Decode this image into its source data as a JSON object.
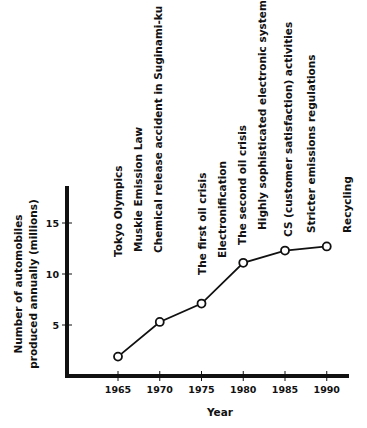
{
  "chart_data": {
    "type": "line",
    "title": "",
    "xlabel": "Year",
    "ylabel": [
      "Number of automobiles",
      "produced annually (millions)"
    ],
    "x": [
      1965,
      1970,
      1975,
      1980,
      1985,
      1990
    ],
    "series": [
      {
        "name": "Automobiles produced annually (millions)",
        "values": [
          1.9,
          5.3,
          7.1,
          11.1,
          12.3,
          12.7
        ]
      }
    ],
    "xlim": [
      1960,
      1992
    ],
    "ylim": [
      0,
      18.5
    ],
    "x_ticks": [
      "1965",
      "1970",
      "1975",
      "1980",
      "1985",
      "1990"
    ],
    "y_ticks": [
      "5",
      "10",
      "15"
    ],
    "y_tick_values": [
      5,
      10,
      15
    ],
    "grid": false,
    "legend": "none",
    "annotations": [
      {
        "text": "Tokyo Olympics",
        "x": 1965
      },
      {
        "text": "Muskie Emission Law",
        "x": 1967.4
      },
      {
        "text": "Chemical release accident in Suginami-ku",
        "x": 1969.8
      },
      {
        "text": "The first oil crisis",
        "x": 1975
      },
      {
        "text": "Electronification",
        "x": 1977.4
      },
      {
        "text": "The second oil crisis",
        "x": 1979.8
      },
      {
        "text": "Highly sophisticated electronic systems",
        "x": 1982.3
      },
      {
        "text": "CS (customer satisfaction) activities",
        "x": 1985.3
      },
      {
        "text": "Stricter emissions regulations",
        "x": 1988.1
      },
      {
        "text": "Recycling",
        "x": 1992.4
      }
    ],
    "colors": {
      "ink": "#111111",
      "marker_fill": "#ffffff"
    }
  }
}
